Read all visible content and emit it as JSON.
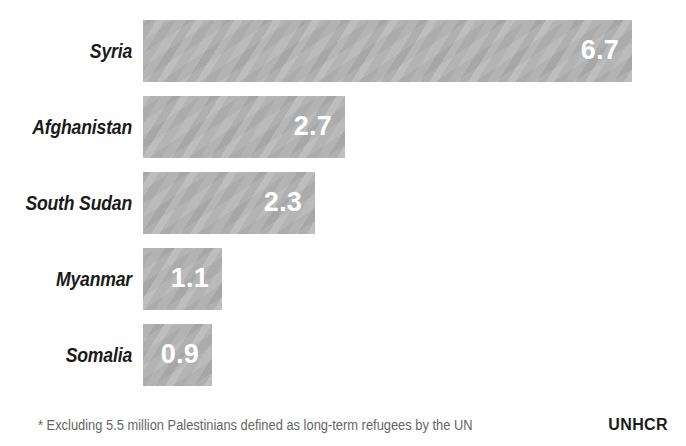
{
  "chart_data": {
    "type": "bar",
    "orientation": "horizontal",
    "title": "",
    "subtitle": "",
    "xlabel": "",
    "ylabel": "",
    "categories": [
      "Syria",
      "Afghanistan",
      "South Sudan",
      "Myanmar",
      "Somalia"
    ],
    "values": [
      6.7,
      2.7,
      2.3,
      1.1,
      0.9
    ],
    "value_labels": [
      "6.7",
      "2.7",
      "2.3",
      "1.1",
      "0.9"
    ],
    "unit": "millions of refugees",
    "grid": false,
    "legend": false,
    "xlim": [
      0,
      6.7
    ],
    "bar_color": "#b3b3b3",
    "value_label_color": "#ffffff",
    "category_label_color": "#1a1a1a",
    "bars": [
      {
        "category": "Syria",
        "value": 6.7,
        "label": "6.7",
        "pixel_width": 489
      },
      {
        "category": "Afghanistan",
        "value": 2.7,
        "label": "2.7",
        "pixel_width": 202
      },
      {
        "category": "South Sudan",
        "value": 2.3,
        "label": "2.3",
        "pixel_width": 172
      },
      {
        "category": "Myanmar",
        "value": 1.1,
        "label": "1.1",
        "pixel_width": 79
      },
      {
        "category": "Somalia",
        "value": 0.9,
        "label": "0.9",
        "pixel_width": 69
      }
    ],
    "annotations": [
      "* Excluding 5.5 million Palestinians defined as long-term refugees by the UN"
    ]
  },
  "footer": {
    "footnote": "* Excluding 5.5 million Palestinians defined as long-term refugees by the UN",
    "source": "UNHCR"
  }
}
